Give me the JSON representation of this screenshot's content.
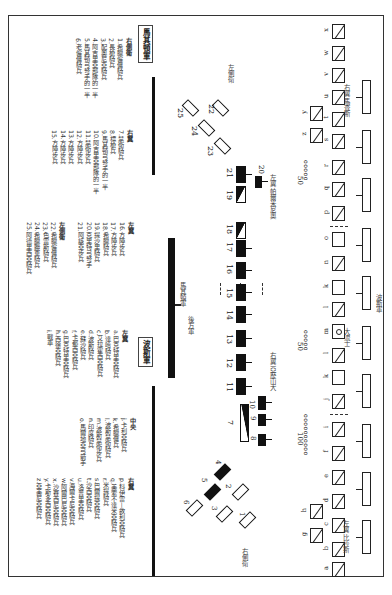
{
  "diagram": {
    "orientation": "rotated-90-ccw",
    "macedonian_army": {
      "title": "馬其頓軍",
      "right_flank_guard": {
        "heading": "右側衛",
        "items": [
          "1.希臘僱傭騎兵",
          "2.長槍騎兵",
          "3.配奧尼亞騎兵",
          "4.阿吉里亞部隊的一半",
          "5.馬其頓弓弩手的一半",
          "6.老僱傭騎兵"
        ]
      },
      "right_wing": {
        "heading": "右翼",
        "items": [
          "7.禁衛騎兵",
          "8.標槍兵",
          "9.馬其頓弓弩手的一半",
          "10.阿吉里亞部隊的一半",
          "11.禁衛步兵",
          "12.方陣步兵",
          "13.方陣步兵",
          "14.方陣步兵",
          "15.方陣步兵"
        ]
      },
      "left_wing": {
        "heading": "左翼",
        "items": [
          "16.方陣步兵",
          "17.方陣步兵",
          "18.希臘騎兵",
          "19.提沙里騎兵",
          "20.克里特弓弩手",
          "21.阿該亞步兵"
        ]
      },
      "left_flank_guard": {
        "heading": "左側衛",
        "items": [
          "22.希臘僱傭騎兵",
          "23.色雷斯騎兵",
          "24.希臘聯軍騎兵",
          "25.阿德里西亞騎兵"
        ]
      },
      "rear_label": "後方軍"
    },
    "persian_army": {
      "title": "波斯軍",
      "left_wing": {
        "heading": "左翼",
        "items": [
          "a.巴克特里亞騎兵",
          "b.達哈騎兵",
          "c.艾拉霍西亞騎兵",
          "d.波斯騎兵",
          "e.蘇沙騎兵",
          "f.卡都西亞騎兵",
          "g.巴克特里亞騎兵",
          "h.西徐亞騎兵",
          "i.戰車"
        ]
      },
      "center": {
        "heading": "中央",
        "items": [
          "j.卡利亞騎兵",
          "k.希臘傭兵",
          "l.波斯禁衛騎兵",
          "m.波斯禁衛步兵",
          "n.印度騎兵",
          "o.馬爾地亞弓箭手"
        ]
      },
      "right_wing": {
        "heading": "右翼",
        "items": [
          "p.科伊雷—敘利亞騎兵",
          "q.美索不達米亞騎兵",
          "r.米提騎兵",
          "s.巴爾提亞騎兵",
          "t.沙西亞騎兵",
          "u.洛普里亞騎兵",
          "v.海爾卡尼亞騎兵",
          "w.阿爾巴尼亞騎兵",
          "x.沙賽西尼亞騎兵",
          "y.卡斯多西亞騎兵",
          "z.亞美尼亞騎兵"
        ]
      }
    },
    "map_labels": {
      "left_flank_guard": "左側衛",
      "right_flank_guard": "右側衛",
      "right_wing_mazaeus": "右翼 馬查斯",
      "left_wing_parmenion": "左翼 帕爾米尼奧",
      "right_wing_alexander": "右翼 亞歷山大",
      "left_wing_bessus": "左翼 比沙斯",
      "darius": "大流士",
      "persian_army": "波斯軍",
      "macedonian_army": "馬其頓軍",
      "rear_army": "後方軍"
    },
    "unit_numbers": [
      "1",
      "2",
      "3",
      "4",
      "5",
      "6",
      "7",
      "8",
      "9",
      "10",
      "11",
      "12",
      "13",
      "14",
      "15",
      "16",
      "17",
      "18",
      "19",
      "20",
      "21",
      "22",
      "23",
      "24",
      "25"
    ],
    "chariot_counts": [
      "50",
      "50",
      "100"
    ],
    "persian_front_letters": [
      "x",
      "w",
      "v",
      "u",
      "t",
      "s",
      "r",
      "q",
      "p",
      "o",
      "n",
      "k",
      "l",
      "m",
      "l",
      "k",
      "j",
      "i",
      "f",
      "e",
      "d",
      "c",
      "b",
      "a"
    ],
    "persian_second_letters": [
      "y",
      "z",
      "h",
      "g"
    ]
  }
}
